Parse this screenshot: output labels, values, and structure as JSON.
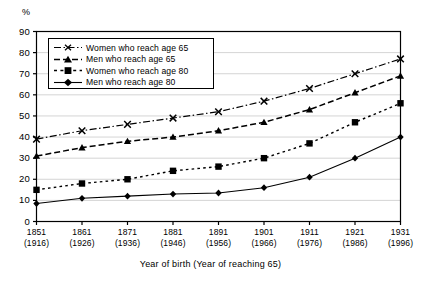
{
  "chart_data": {
    "type": "line",
    "title": "",
    "xlabel": "Year of birth (Year of reaching 65)",
    "ylabel": "%",
    "ylim": [
      0,
      90
    ],
    "ytick_step": 10,
    "yticks": [
      "90",
      "80",
      "70",
      "60",
      "50",
      "40",
      "30",
      "20",
      "10",
      "0"
    ],
    "grid": "horizontal",
    "legend_position": "top-left-inside",
    "categories": [
      "1851\n(1916)",
      "1861\n(1926)",
      "1871\n(1936)",
      "1881\n(1946)",
      "1891\n(1956)",
      "1901\n(1966)",
      "1911\n(1976)",
      "1921\n(1986)",
      "1931\n(1996)"
    ],
    "xtick_birth": [
      "1851",
      "1861",
      "1871",
      "1881",
      "1891",
      "1901",
      "1911",
      "1921",
      "1931"
    ],
    "xtick_reach": [
      "(1916)",
      "(1926)",
      "(1936)",
      "(1946)",
      "(1956)",
      "(1966)",
      "(1976)",
      "(1986)",
      "(1996)"
    ],
    "series": [
      {
        "name": "Women who  reach age 65",
        "marker": "cross-icon",
        "line_style": "dash-dot",
        "color": "#000000",
        "values": [
          39,
          43,
          46,
          49,
          52,
          57,
          63,
          70,
          77
        ]
      },
      {
        "name": "Men who  reach age 65",
        "marker": "triangle-icon",
        "line_style": "dashed",
        "color": "#000000",
        "values": [
          31,
          35,
          38,
          40,
          43,
          47,
          53,
          61,
          69
        ]
      },
      {
        "name": "Women who  reach age 80",
        "marker": "square-icon",
        "line_style": "dotted",
        "color": "#000000",
        "values": [
          15,
          18,
          20,
          24,
          26,
          30,
          37,
          47,
          56
        ]
      },
      {
        "name": "Men who  reach age 80",
        "marker": "diamond-icon",
        "line_style": "solid",
        "color": "#000000",
        "values": [
          8.5,
          11,
          12,
          13,
          13.5,
          16,
          21,
          30,
          40
        ]
      }
    ]
  },
  "legend": {
    "items": [
      {
        "label": "Women who  reach age 65"
      },
      {
        "label": "Men who  reach age 65"
      },
      {
        "label": "Women who  reach age 80"
      },
      {
        "label": "Men who  reach age 80"
      }
    ]
  },
  "axis": {
    "y_unit": "%",
    "x_title": "Year of birth (Year of reaching 65)"
  }
}
